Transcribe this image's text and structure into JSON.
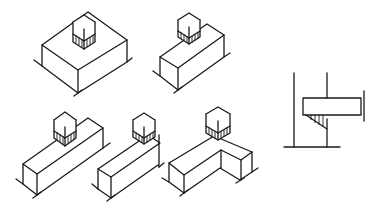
{
  "figure": {
    "stroke_color": "#1a1a1a",
    "background": "#ffffff",
    "panels": [
      {
        "id": "isolated-footing",
        "label": ""
      },
      {
        "id": "strip-footing-center",
        "label": ""
      },
      {
        "id": "strip-footing-end",
        "label": ""
      },
      {
        "id": "strip-footing-end-offset",
        "label": ""
      },
      {
        "id": "corner-footing",
        "label": ""
      },
      {
        "id": "corbel-section",
        "label": ""
      }
    ]
  }
}
